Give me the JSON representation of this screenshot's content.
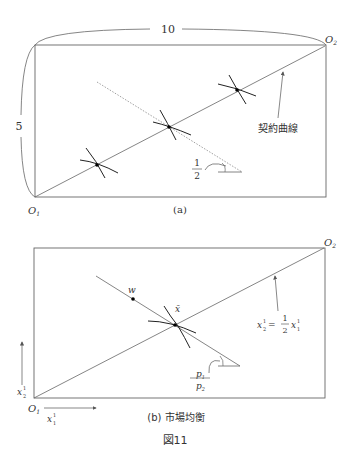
{
  "figure": {
    "caption": "図11",
    "panel_a": {
      "caption": "(a)",
      "width_label": "10",
      "height_label": "5",
      "origin_1": "O",
      "origin_1_sub": "1",
      "origin_2": "O",
      "origin_2_sub": "2",
      "contract_curve_label": "契約曲線",
      "slope_numerator": "1",
      "slope_denominator": "2"
    },
    "panel_b": {
      "caption": "(b) 市場均衡",
      "origin_1": "O",
      "origin_1_sub": "1",
      "origin_2": "O",
      "origin_2_sub": "2",
      "endowment_label": "w",
      "equilibrium_label": "x̄",
      "price_ratio_numerator": "p",
      "price_ratio_numerator_sub": "1",
      "price_ratio_denominator": "p",
      "price_ratio_denominator_sub": "2",
      "equation_lhs": "x",
      "equation_lhs_sup": "1",
      "equation_lhs_sub": "2",
      "equation_eq": "=",
      "equation_frac_num": "1",
      "equation_frac_den": "2",
      "equation_rhs": "x",
      "equation_rhs_sup": "1",
      "equation_rhs_sub": "1",
      "axis_y_label": "x",
      "axis_y_sup": "1",
      "axis_y_sub": "2",
      "axis_x_label": "x",
      "axis_x_sup": "1",
      "axis_x_sub": "1"
    }
  }
}
